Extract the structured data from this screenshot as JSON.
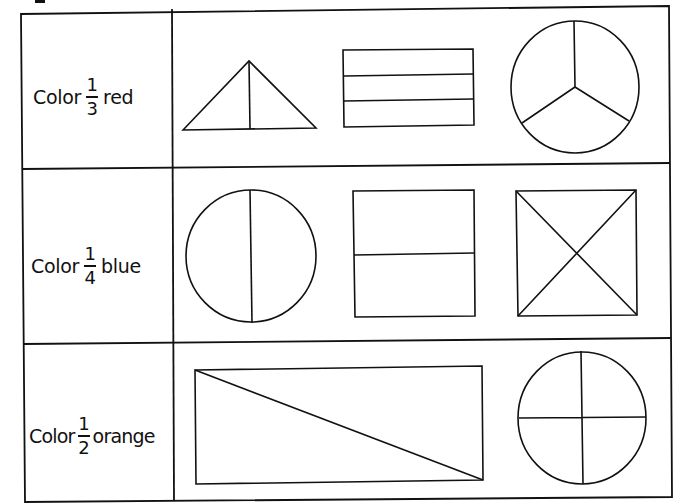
{
  "worksheet": {
    "rows": [
      {
        "instruction_prefix": "Color",
        "numerator": "1",
        "denominator": "3",
        "color_word": "red",
        "shapes": [
          "triangle-split-in-2",
          "rectangle-split-in-3",
          "circle-split-in-3"
        ]
      },
      {
        "instruction_prefix": "Color",
        "numerator": "1",
        "denominator": "4",
        "color_word": "blue",
        "shapes": [
          "circle-split-in-2",
          "rectangle-split-in-2",
          "square-split-in-4-diagonals"
        ]
      },
      {
        "instruction_prefix": "Color",
        "numerator": "1",
        "denominator": "2",
        "color_word": "orange",
        "shapes": [
          "rectangle-split-diagonally-in-2",
          "circle-split-in-4"
        ]
      }
    ],
    "line_color": "#111111",
    "background": "#ffffff"
  }
}
